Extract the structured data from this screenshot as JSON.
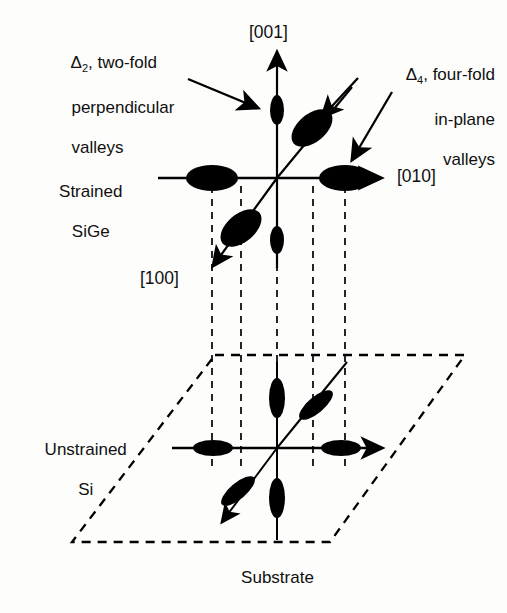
{
  "figure": {
    "type": "band-structure-valley-diagram",
    "ink_color": "#000000",
    "text_color": "#101010",
    "background": "#fdfdfc"
  },
  "annotations": {
    "delta2": {
      "symbol": "Δ",
      "subscript": "2",
      "line1": ", two-fold",
      "line2": "perpendicular",
      "line3": "valleys",
      "plain": "Δ2, two-fold perpendicular valleys"
    },
    "delta4": {
      "symbol": "Δ",
      "subscript": "4",
      "line1": ", four-fold",
      "line2": "in-plane",
      "line3": "valleys",
      "plain": "Δ4, four-fold in-plane valleys"
    }
  },
  "labels": {
    "strained_line1": "Strained",
    "strained_line2": "SiGe",
    "unstrained_line1": "Unstrained",
    "unstrained_line2": "Si",
    "substrate": "Substrate"
  },
  "axes": {
    "vertical": "[001]",
    "horizontal": "[010]",
    "diagonal": "[100]"
  },
  "chart_data": {
    "type": "diagram",
    "panels": [
      {
        "name": "strained-sige",
        "label": "Strained SiGe",
        "origin": [
          277,
          178
        ],
        "valleys": [
          {
            "axis": "[001]",
            "direction": "up",
            "center": [
              277,
              110
            ],
            "rx": 7,
            "ry": 15,
            "rot": 0,
            "family": "delta2"
          },
          {
            "axis": "[001]",
            "direction": "down",
            "center": [
              277,
              240
            ],
            "rx": 7,
            "ry": 14,
            "rot": 0,
            "family": "delta2"
          },
          {
            "axis": "[010]",
            "direction": "left",
            "center": [
              212,
              178
            ],
            "rx": 26,
            "ry": 13,
            "rot": 0,
            "family": "delta4"
          },
          {
            "axis": "[010]",
            "direction": "right",
            "center": [
              345,
              178
            ],
            "rx": 26,
            "ry": 13,
            "rot": 0,
            "family": "delta4"
          },
          {
            "axis": "[100]",
            "direction": "back",
            "center": [
              312,
              128
            ],
            "rx": 24,
            "ry": 14,
            "rot": -40,
            "family": "delta4"
          },
          {
            "axis": "[100]",
            "direction": "front",
            "center": [
              241,
              228
            ],
            "rx": 24,
            "ry": 14,
            "rot": -40,
            "family": "delta4"
          }
        ],
        "note": "Delta-2 valleys along [001] are small; Delta-4 in-plane valleys are large"
      },
      {
        "name": "unstrained-si",
        "label": "Unstrained Si",
        "origin": [
          277,
          448
        ],
        "valleys": [
          {
            "axis": "[001]",
            "direction": "up",
            "center": [
              277,
              398
            ],
            "rx": 8,
            "ry": 20,
            "rot": 0,
            "family": "equal"
          },
          {
            "axis": "[001]",
            "direction": "down",
            "center": [
              277,
              498
            ],
            "rx": 8,
            "ry": 20,
            "rot": 0,
            "family": "equal"
          },
          {
            "axis": "[010]",
            "direction": "left",
            "center": [
              213,
              448
            ],
            "rx": 20,
            "ry": 8,
            "rot": 0,
            "family": "equal"
          },
          {
            "axis": "[010]",
            "direction": "right",
            "center": [
              341,
              448
            ],
            "rx": 20,
            "ry": 8,
            "rot": 0,
            "family": "equal"
          },
          {
            "axis": "[100]",
            "direction": "back",
            "center": [
              316,
              405
            ],
            "rx": 21,
            "ry": 8,
            "rot": -40,
            "family": "equal"
          },
          {
            "axis": "[100]",
            "direction": "front",
            "center": [
              238,
              491
            ],
            "rx": 21,
            "ry": 8,
            "rot": -40,
            "family": "equal"
          }
        ],
        "note": "All six valleys equivalent (isotropic, degenerate)"
      }
    ],
    "substrate_plane": {
      "shape": "parallelogram",
      "style": "dashed",
      "corners": [
        [
          215,
          355
        ],
        [
          465,
          355
        ],
        [
          330,
          542
        ],
        [
          72,
          542
        ]
      ]
    },
    "projection_lines": {
      "style": "dashed",
      "count": 5,
      "x_positions": [
        212,
        241,
        277,
        313,
        345
      ],
      "y_from": 186,
      "y_to": 470
    }
  }
}
